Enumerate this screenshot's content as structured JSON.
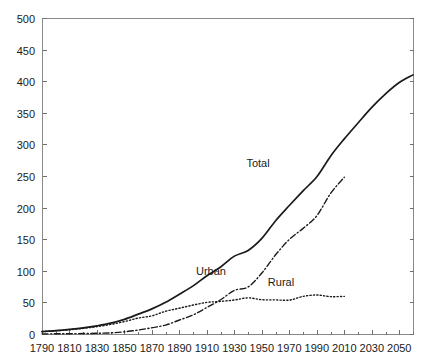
{
  "chart_data": {
    "type": "line",
    "title": "",
    "subtitle": "",
    "xlabel": "",
    "ylabel": "",
    "xlim": [
      1790,
      2060
    ],
    "ylim": [
      0,
      500
    ],
    "xticks": [
      1790,
      1810,
      1830,
      1850,
      1870,
      1890,
      1910,
      1930,
      1950,
      1970,
      1990,
      2010,
      2030,
      2050
    ],
    "yticks": [
      0,
      50,
      100,
      150,
      200,
      250,
      300,
      350,
      400,
      450,
      500
    ],
    "x_minor_tick_interval": 10,
    "grid": false,
    "legend_position": "inline-annotations",
    "series": [
      {
        "name": "Total",
        "label": "Total",
        "line_style": "solid",
        "color": "#1a1a1a",
        "x": [
          1790,
          1800,
          1810,
          1820,
          1830,
          1840,
          1850,
          1860,
          1870,
          1880,
          1890,
          1900,
          1910,
          1920,
          1930,
          1940,
          1950,
          1960,
          1970,
          1980,
          1990,
          2000,
          2010,
          2020,
          2030,
          2040,
          2050,
          2060
        ],
        "values": [
          3.9,
          5.3,
          7.2,
          9.6,
          12.9,
          17.1,
          23.2,
          31.4,
          39.8,
          50.2,
          62.9,
          76.2,
          92.2,
          106.0,
          123.2,
          132.2,
          151.3,
          179.3,
          203.3,
          226.5,
          248.7,
          281.4,
          308.7,
          333.9,
          358.5,
          380.0,
          398.0,
          410.0
        ]
      },
      {
        "name": "Urban",
        "label": "Urban",
        "line_style": "dash-dot",
        "color": "#1a1a1a",
        "x": [
          1790,
          1800,
          1810,
          1820,
          1830,
          1840,
          1850,
          1860,
          1870,
          1880,
          1890,
          1900,
          1910,
          1920,
          1930,
          1940,
          1950,
          1960,
          1970,
          1980,
          1990,
          2000,
          2010
        ],
        "values": [
          0.2,
          0.3,
          0.5,
          0.7,
          1.1,
          1.8,
          3.5,
          6.2,
          9.9,
          14.1,
          22.1,
          30.2,
          42.0,
          54.2,
          69.0,
          74.4,
          96.5,
          125.3,
          149.6,
          167.1,
          187.1,
          222.4,
          248.0
        ]
      },
      {
        "name": "Rural",
        "label": "Rural",
        "line_style": "dotted",
        "color": "#1a1a1a",
        "x": [
          1790,
          1800,
          1810,
          1820,
          1830,
          1840,
          1850,
          1860,
          1870,
          1880,
          1890,
          1900,
          1910,
          1920,
          1930,
          1940,
          1950,
          1960,
          1970,
          1980,
          1990,
          2000,
          2010
        ],
        "values": [
          3.7,
          5.0,
          6.7,
          8.9,
          11.7,
          15.2,
          19.6,
          25.2,
          28.7,
          36.0,
          40.8,
          45.8,
          50.0,
          51.6,
          53.8,
          57.2,
          54.2,
          54.0,
          53.6,
          59.5,
          61.7,
          59.1,
          59.5
        ]
      }
    ],
    "annotations": [
      {
        "text": "Total",
        "x_px": 258,
        "y_px": 167
      },
      {
        "text": "Urban",
        "x_px": 211,
        "y_px": 275
      },
      {
        "text": "Rural",
        "x_px": 281,
        "y_px": 286
      }
    ]
  },
  "axes": {
    "plot_left_px": 42,
    "plot_right_px": 413,
    "plot_top_px": 18,
    "plot_bottom_px": 334
  }
}
